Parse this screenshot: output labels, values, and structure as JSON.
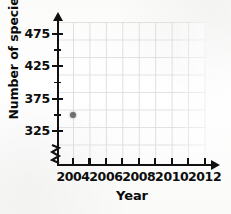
{
  "chart_data": {
    "type": "scatter",
    "title": "",
    "xlabel": "Year",
    "ylabel": "Number of species",
    "x": [
      2004
    ],
    "values": [
      350
    ],
    "points": [
      {
        "x": 2004,
        "y": 350
      }
    ],
    "series": [
      {
        "name": "Number of species",
        "points": [
          {
            "x": 2004,
            "y": 350
          }
        ],
        "marker_color": "#6f6f6f"
      }
    ],
    "xlim": [
      2003,
      2013
    ],
    "ylim": [
      310,
      490
    ],
    "x_tick_labels": [
      "2004",
      "2006",
      "2008",
      "2010",
      "2012"
    ],
    "x_major_ticks": [
      2004,
      2006,
      2008,
      2010,
      2012
    ],
    "x_minor_ticks": [
      2005,
      2007,
      2009,
      2011,
      2012
    ],
    "x_all_ticks": [
      2004,
      2005,
      2006,
      2007,
      2008,
      2009,
      2010,
      2011,
      2012
    ],
    "y_tick_labels": [
      "325",
      "375",
      "425",
      "475"
    ],
    "y_major_ticks": [
      325,
      375,
      425,
      475
    ],
    "y_minor_ticks": [
      350,
      400,
      450
    ],
    "grid": true,
    "grid_color": "#dedede",
    "axis_color": "#111111",
    "y_axis_break": true,
    "legend": "none",
    "x_arrow": true,
    "y_arrow": true
  },
  "axis_titles": {
    "y": "Number of species",
    "x": "Year"
  },
  "ticks": {
    "y": [
      {
        "label": "475",
        "value": 475
      },
      {
        "label": "425",
        "value": 425
      },
      {
        "label": "375",
        "value": 375
      },
      {
        "label": "325",
        "value": 325
      }
    ],
    "x": [
      {
        "label": "2004",
        "value": 2004
      },
      {
        "label": "2006",
        "value": 2006
      },
      {
        "label": "2008",
        "value": 2008
      },
      {
        "label": "2010",
        "value": 2010
      },
      {
        "label": "2012",
        "value": 2012
      }
    ]
  },
  "icons": {
    "y_axis_arrow": "arrow-up-icon",
    "x_axis_arrow": "arrow-right-icon",
    "axis_break": "axis-break-zigzag-icon"
  }
}
